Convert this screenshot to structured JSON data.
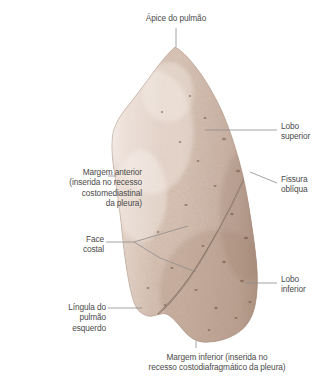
{
  "figure": {
    "title_label": "Ápice do pulmão",
    "colors": {
      "text": "#4b4b4b",
      "leader_line": "#8d8d8d",
      "background": "#ffffff",
      "tissue_light": "#e9dcd3",
      "tissue_mid": "#d6c0b3",
      "tissue_dark": "#bda596",
      "tissue_shadow": "#a98d7d",
      "fissure_line": "#6e584b"
    }
  },
  "labels": [
    {
      "id": "apice",
      "text": "Ápice do pulmão",
      "align": "center",
      "side": "top",
      "structure": "apex-of-lung"
    },
    {
      "id": "lobo_superior",
      "text": "Lobo\nsuperior",
      "align": "left",
      "side": "right",
      "structure": "superior-lobe"
    },
    {
      "id": "fissura_obliqua",
      "text": "Fissura\noblíqua",
      "align": "left",
      "side": "right",
      "structure": "oblique-fissure"
    },
    {
      "id": "lobo_inferior",
      "text": "Lobo\ninferior",
      "align": "left",
      "side": "right",
      "structure": "inferior-lobe"
    },
    {
      "id": "margem_anterior",
      "text": "Margem anterior\n(inserida no recesso\ncostomediastinal\nda pleura)",
      "align": "right",
      "side": "left",
      "structure": "anterior-margin"
    },
    {
      "id": "face_costal",
      "text": "Face\ncostal",
      "align": "right",
      "side": "left",
      "structure": "costal-surface"
    },
    {
      "id": "lingula",
      "text": "Língula do\npulmão\nesquerdo",
      "align": "right",
      "side": "left",
      "structure": "lingula-of-left-lung"
    },
    {
      "id": "margem_inferior",
      "text": "Margem inferior (inserida no\nrecesso costodiafragmático da pleura)",
      "align": "center",
      "side": "bottom",
      "structure": "inferior-margin"
    }
  ]
}
